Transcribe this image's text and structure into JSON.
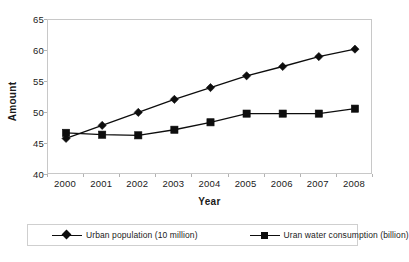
{
  "chart_data": {
    "type": "line",
    "title": "",
    "xlabel": "Year",
    "ylabel": "Amount",
    "categories": [
      "2000",
      "2001",
      "2002",
      "2003",
      "2004",
      "2005",
      "2006",
      "2007",
      "2008"
    ],
    "series": [
      {
        "name": "Urban population (10 million)",
        "marker": "diamond",
        "color": "#0d0d0d",
        "values": [
          45.9,
          48.0,
          50.1,
          52.2,
          54.1,
          56.0,
          57.5,
          59.1,
          60.3
        ]
      },
      {
        "name": "Uran water consumption (billion)",
        "marker": "square",
        "color": "#0d0d0d",
        "values": [
          46.8,
          46.5,
          46.4,
          47.3,
          48.5,
          49.9,
          49.9,
          49.9,
          50.7
        ]
      }
    ],
    "ylim": [
      40,
      65
    ],
    "yticks": [
      40,
      45,
      50,
      55,
      60,
      65
    ],
    "ytick_labels": [
      "40",
      "45",
      "50",
      "55",
      "60",
      "65"
    ],
    "grid": false,
    "legend_position": "bottom",
    "plot_border_color": "#c8c8c8",
    "axis_color": "#b3b3b3",
    "text_color": "#1a1a1a"
  }
}
